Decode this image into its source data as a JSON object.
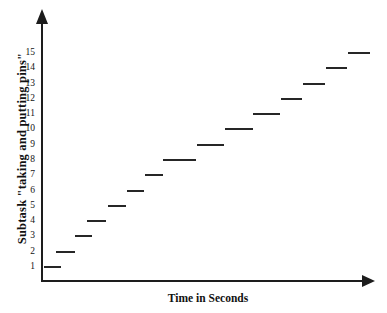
{
  "chart_data": {
    "type": "line",
    "subtype": "step-scatter",
    "title": "",
    "xlabel": "Time in Seconds",
    "ylabel": "Subtask \"taking and putting pins\"",
    "grid": false,
    "legend": null,
    "ylim": [
      0,
      16
    ],
    "xlim": [
      0,
      100
    ],
    "ytick_labels": [
      "1",
      "2",
      "3",
      "4",
      "5",
      "6",
      "7",
      "8",
      "9",
      "10",
      "11",
      "12",
      "13",
      "14",
      "15"
    ],
    "ytick_values": [
      1,
      2,
      3,
      4,
      5,
      6,
      7,
      8,
      9,
      10,
      11,
      12,
      13,
      14,
      15
    ],
    "xtick_labels": [],
    "series": [
      {
        "name": "Subtask repetitions",
        "values": [
          1,
          2,
          3,
          4,
          5,
          6,
          7,
          8,
          9,
          10,
          11,
          12,
          13,
          14,
          15
        ]
      }
    ],
    "segments": [
      {
        "y": 1,
        "x_start": 0.3,
        "x_end": 6.4
      },
      {
        "y": 2,
        "x_start": 4.6,
        "x_end": 11.8
      },
      {
        "y": 3,
        "x_start": 11.5,
        "x_end": 17.8
      },
      {
        "y": 4,
        "x_start": 16.2,
        "x_end": 23.1
      },
      {
        "y": 5,
        "x_start": 23.6,
        "x_end": 30.2
      },
      {
        "y": 6,
        "x_start": 30.5,
        "x_end": 37.0
      },
      {
        "y": 7,
        "x_start": 37.3,
        "x_end": 43.8
      },
      {
        "y": 8,
        "x_start": 43.8,
        "x_end": 56.0
      },
      {
        "y": 9,
        "x_start": 56.3,
        "x_end": 66.2
      },
      {
        "y": 10,
        "x_start": 66.5,
        "x_end": 76.5
      },
      {
        "y": 11,
        "x_start": 76.8,
        "x_end": 86.5
      },
      {
        "y": 12,
        "x_start": 86.8,
        "x_end": 94.5
      },
      {
        "y": 13,
        "x_start": 94.8,
        "x_end": 103.0
      },
      {
        "y": 14,
        "x_start": 103.3,
        "x_end": 111.0
      },
      {
        "y": 15,
        "x_start": 111.3,
        "x_end": 119.5
      }
    ]
  },
  "axes": {
    "y_axis_name": "vertical-axis",
    "x_axis_name": "horizontal-axis",
    "y_arrow": "arrow-up-icon",
    "x_arrow": "arrow-right-icon"
  }
}
